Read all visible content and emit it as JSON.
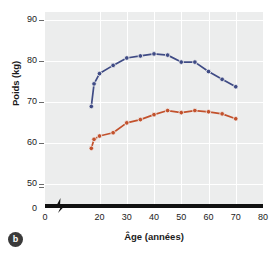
{
  "figure": {
    "panel_label": "b"
  },
  "chart_data": {
    "type": "line",
    "title": "",
    "xlabel": "Âge (années)",
    "ylabel": "Poids (kg)",
    "xlim": [
      0,
      80
    ],
    "ylim": [
      45,
      92
    ],
    "grid": true,
    "legend": "none",
    "axis_break_x": true,
    "y_ticks": [
      50,
      60,
      70,
      80,
      90
    ],
    "y_tick_labels": [
      "50",
      "60",
      "70",
      "80",
      "90"
    ],
    "y_zero_label": "0",
    "x_ticks": [
      0,
      20,
      30,
      40,
      50,
      60,
      70,
      80
    ],
    "x_tick_labels": [
      "0",
      "20",
      "30",
      "40",
      "50",
      "60",
      "70",
      "80"
    ],
    "x": [
      17,
      18,
      20,
      25,
      30,
      35,
      40,
      45,
      50,
      55,
      60,
      65,
      70
    ],
    "series": [
      {
        "name": "upper-series",
        "color": "#3f4b85",
        "marker": "circle",
        "values": [
          69.0,
          74.5,
          77.0,
          79.0,
          80.8,
          81.3,
          81.8,
          81.5,
          79.8,
          79.8,
          77.5,
          75.6,
          73.8
        ]
      },
      {
        "name": "lower-series",
        "color": "#c2512c",
        "marker": "circle",
        "values": [
          58.8,
          61.0,
          61.8,
          62.6,
          65.0,
          65.8,
          67.0,
          68.0,
          67.5,
          68.0,
          67.7,
          67.2,
          66.0
        ]
      }
    ],
    "colors": {
      "upper": "#3f4b85",
      "lower": "#c2512c",
      "plot_background": "#eceded",
      "gridline": "#ffffff",
      "axis": "#111111"
    }
  }
}
